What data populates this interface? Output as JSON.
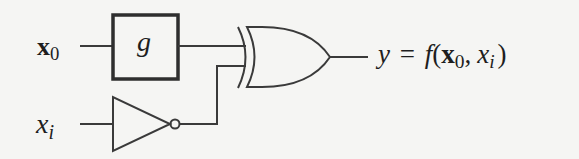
{
  "diagram": {
    "type": "logic-circuit",
    "inputs": [
      {
        "id": "x0",
        "symbol": "x",
        "subscript": "0",
        "style": "bold-vector"
      },
      {
        "id": "xi",
        "symbol": "x",
        "subscript": "i",
        "style": "italic-scalar"
      }
    ],
    "blocks": [
      {
        "id": "g",
        "label": "g",
        "kind": "function-box",
        "input": "x0"
      },
      {
        "id": "not",
        "label": "",
        "kind": "NOT-gate",
        "input": "xi"
      },
      {
        "id": "xor",
        "label": "",
        "kind": "XOR-gate",
        "inputs": [
          "g",
          "not"
        ]
      }
    ],
    "output": {
      "lhs": "y",
      "equals": "=",
      "func": "f",
      "open_paren": "(",
      "arg1_symbol": "x",
      "arg1_sub": "0",
      "comma": ",",
      "arg2_symbol": "x",
      "arg2_sub": "i",
      "close_paren": ")"
    },
    "colors": {
      "background": "#f5f5f3",
      "stroke": "#3a3a3a",
      "text": "#1e1e1e"
    }
  }
}
